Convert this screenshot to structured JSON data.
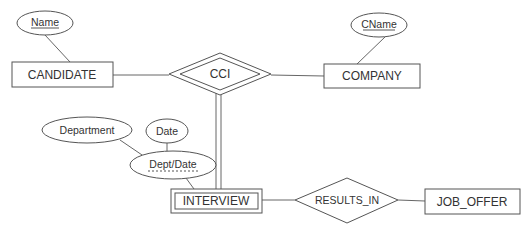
{
  "diagram": {
    "type": "er-diagram",
    "entities": [
      {
        "id": "candidate",
        "label": "CANDIDATE",
        "weak": false
      },
      {
        "id": "company",
        "label": "COMPANY",
        "weak": false
      },
      {
        "id": "interview",
        "label": "INTERVIEW",
        "weak": true
      },
      {
        "id": "job_offer",
        "label": "JOB_OFFER",
        "weak": false
      }
    ],
    "relationships": [
      {
        "id": "cci",
        "label": "CCI",
        "identifying": true
      },
      {
        "id": "results_in",
        "label": "RESULTS_IN",
        "identifying": false
      }
    ],
    "attributes": [
      {
        "id": "name",
        "label": "Name",
        "owner": "CANDIDATE",
        "key": true
      },
      {
        "id": "cname",
        "label": "CName",
        "owner": "COMPANY",
        "key": true
      },
      {
        "id": "dept_date",
        "label": "Dept/Date",
        "owner": "INTERVIEW",
        "partial_key": true,
        "composite": true
      },
      {
        "id": "department",
        "label": "Department",
        "owner": "Dept/Date"
      },
      {
        "id": "date",
        "label": "Date",
        "owner": "Dept/Date"
      }
    ],
    "connections": [
      {
        "from": "CANDIDATE",
        "to": "CCI",
        "style": "single"
      },
      {
        "from": "COMPANY",
        "to": "CCI",
        "style": "single"
      },
      {
        "from": "INTERVIEW",
        "to": "CCI",
        "style": "double"
      },
      {
        "from": "INTERVIEW",
        "to": "RESULTS_IN",
        "style": "single"
      },
      {
        "from": "JOB_OFFER",
        "to": "RESULTS_IN",
        "style": "single"
      }
    ]
  }
}
